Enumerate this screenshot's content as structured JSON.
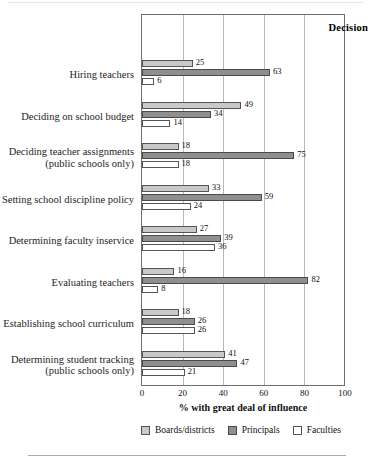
{
  "figure": {
    "axis_header": "Decision",
    "xaxis_title": "% with great deal of influence"
  },
  "chart_data": {
    "type": "bar",
    "orientation": "horizontal",
    "title": "",
    "subtitle": "",
    "xlabel": "% with great deal of influence",
    "ylabel": "Decision",
    "xlim": [
      0,
      100
    ],
    "xticks": [
      0,
      20,
      40,
      60,
      80,
      100
    ],
    "grid": "vertical",
    "legend_position": "bottom",
    "categories": [
      "Hiring teachers",
      "Deciding on school budget",
      "Deciding teacher assignments (public schools only)",
      "Setting school discipline policy",
      "Determining faculty inservice",
      "Evaluating teachers",
      "Establishing school curriculum",
      "Determining student tracking (public schools only)"
    ],
    "category_lines": [
      [
        "Hiring teachers"
      ],
      [
        "Deciding on school budget"
      ],
      [
        "Deciding teacher assignments",
        "(public schools only)"
      ],
      [
        "Setting school discipline policy"
      ],
      [
        "Determining faculty inservice"
      ],
      [
        "Evaluating teachers"
      ],
      [
        "Establishing school curriculum"
      ],
      [
        "Determining student tracking",
        "(public schools only)"
      ]
    ],
    "series": [
      {
        "name": "Boards/districts",
        "color": "#c9c9c9",
        "values": [
          25,
          49,
          18,
          33,
          27,
          16,
          18,
          41
        ]
      },
      {
        "name": "Principals",
        "color": "#8f8f8f",
        "values": [
          63,
          34,
          75,
          59,
          39,
          82,
          26,
          47
        ]
      },
      {
        "name": "Faculties",
        "color": "#ffffff",
        "values": [
          6,
          14,
          18,
          24,
          36,
          8,
          26,
          21
        ]
      }
    ],
    "legend": [
      "Boards/districts",
      "Principals",
      "Faculties"
    ]
  }
}
